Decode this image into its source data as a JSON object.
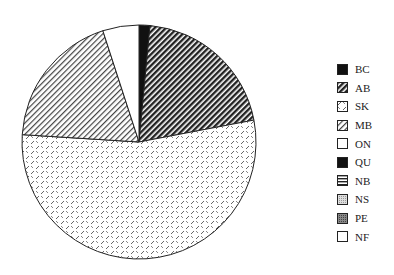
{
  "chart_data": {
    "type": "pie",
    "title": "",
    "categories": [
      "BC",
      "AB",
      "SK",
      "MB",
      "ON",
      "QU",
      "NB",
      "NS",
      "PE",
      "NF"
    ],
    "values": [
      1.5,
      20.5,
      54.0,
      19.0,
      5.0,
      0,
      0,
      0,
      0,
      0
    ],
    "start_angle_deg": 0,
    "direction": "clockwise",
    "legend_position": "right",
    "patterns": [
      "solid-black",
      "dense-diagonal-dark",
      "dash-crosshatch",
      "diagonal-light",
      "white",
      "solid-black",
      "horizontal-lines",
      "stipple-light",
      "stipple-dark",
      "white"
    ]
  },
  "legend": {
    "items": [
      {
        "label": "BC"
      },
      {
        "label": "AB"
      },
      {
        "label": "SK"
      },
      {
        "label": "MB"
      },
      {
        "label": "ON"
      },
      {
        "label": "QU"
      },
      {
        "label": "NB"
      },
      {
        "label": "NS"
      },
      {
        "label": "PE"
      },
      {
        "label": "NF"
      }
    ]
  }
}
